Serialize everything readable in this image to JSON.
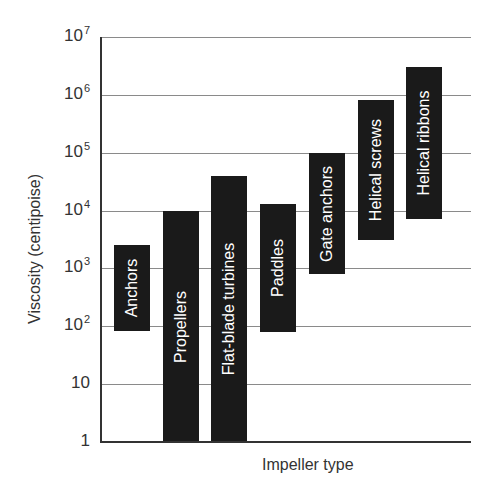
{
  "chart_data": {
    "type": "bar",
    "subtype": "floating-range-bar",
    "title": "",
    "xlabel": "Impeller type",
    "ylabel": "Viscosity (centipoise)",
    "yscale": "log",
    "ylim": [
      1,
      10000000
    ],
    "yticks": [
      {
        "base": "1",
        "exp": ""
      },
      {
        "base": "10",
        "exp": ""
      },
      {
        "base": "10",
        "exp": "2"
      },
      {
        "base": "10",
        "exp": "3"
      },
      {
        "base": "10",
        "exp": "4"
      },
      {
        "base": "10",
        "exp": "5"
      },
      {
        "base": "10",
        "exp": "6"
      },
      {
        "base": "10",
        "exp": "7"
      }
    ],
    "grid": true,
    "legend": null,
    "categories": [
      "Anchors",
      "Propellers",
      "Flat-blade turbines",
      "Paddles",
      "Gate anchors",
      "Helical screws",
      "Helical ribbons"
    ],
    "series": [
      {
        "name": "Viscosity range",
        "low": [
          80,
          1,
          1,
          80,
          800,
          3000,
          7000
        ],
        "high": [
          2500,
          10000,
          40000,
          13000,
          100000,
          800000,
          3000000
        ]
      }
    ],
    "bar_color": "#1a1a1a",
    "label_color": "#ffffff"
  }
}
